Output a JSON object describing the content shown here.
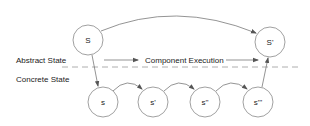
{
  "labels": {
    "abstract_state": "Abstract State",
    "concrete_state": "Concrete State",
    "component_execution": "Component Execution"
  },
  "nodes": {
    "abstract_start": "S",
    "abstract_end": "S'",
    "concrete": [
      "s",
      "s'",
      "s''",
      "s'''"
    ]
  },
  "colors": {
    "stroke": "#666666",
    "text": "#222222",
    "dash": "#999999"
  }
}
